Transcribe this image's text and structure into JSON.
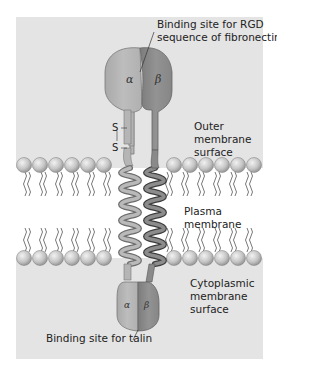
{
  "figure": {
    "type": "integrin-structure-diagram",
    "colors": {
      "panel": "#e3e3e3",
      "alpha_subunit": "#b3b3b3",
      "beta_subunit": "#8a8a8a",
      "lipid_head": "#c8c8c8",
      "membrane_interior": "#ffffff"
    }
  },
  "labels": {
    "rgd_site_line1": "Binding site for RGD",
    "rgd_site_line2": "sequence of fibronectin",
    "outer_line1": "Outer",
    "outer_line2": "membrane",
    "outer_line3": "surface",
    "plasma_line1": "Plasma",
    "plasma_line2": "membrane",
    "cyto_line1": "Cytoplasmic",
    "cyto_line2": "membrane",
    "cyto_line3": "surface",
    "talin_site": "Binding site for talin",
    "disulfide_s1": "S",
    "disulfide_s2": "S",
    "alpha_top": "α",
    "beta_top": "β",
    "alpha_bottom": "α",
    "beta_bottom": "β"
  }
}
